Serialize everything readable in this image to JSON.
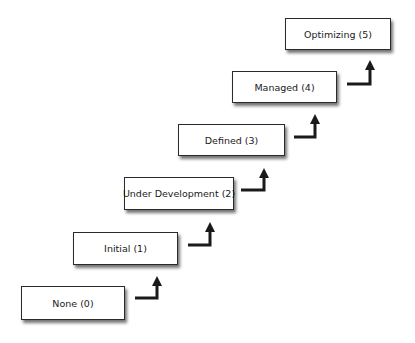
{
  "diagram": {
    "type": "staircase",
    "colors": {
      "box_fill": "#ffffff",
      "box_border": "#2a2a2a",
      "arrow": "#1a1a1a"
    },
    "levels": [
      {
        "label": "None (0)",
        "box": [
          21,
          286,
          104,
          34
        ],
        "arrow": [
          135,
          298,
          158,
          278
        ]
      },
      {
        "label": "Initial (1)",
        "box": [
          73,
          232,
          105,
          33
        ],
        "arrow": [
          188,
          245,
          211,
          224
        ]
      },
      {
        "label": "Under Development (2)",
        "box": [
          124,
          177,
          110,
          33
        ],
        "arrow": [
          241,
          190,
          265,
          170
        ]
      },
      {
        "label": "Defined (3)",
        "box": [
          178,
          124,
          107,
          32
        ],
        "arrow": [
          294,
          137,
          316,
          116
        ]
      },
      {
        "label": "Managed (4)",
        "box": [
          232,
          71,
          105,
          32
        ],
        "arrow": [
          347,
          84,
          371,
          62
        ]
      },
      {
        "label": "Optimizing (5)",
        "box": [
          285,
          18,
          106,
          32
        ],
        "arrow": null
      }
    ]
  }
}
